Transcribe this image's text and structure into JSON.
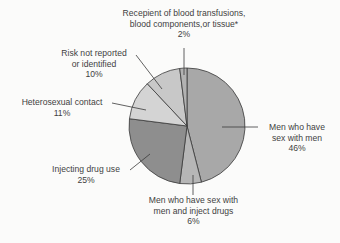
{
  "chart_data": {
    "type": "pie",
    "title": "",
    "start_angle_deg": 0,
    "direction": "clockwise",
    "slices": [
      {
        "label": "Men who have sex with men",
        "value": 46,
        "display": "46%",
        "color": "#a8a8a8"
      },
      {
        "label": "Men who have sex with men and inject drugs",
        "value": 6,
        "display": "6%",
        "color": "#b6b6b6"
      },
      {
        "label": "Injecting drug use",
        "value": 25,
        "display": "25%",
        "color": "#8e8e8e"
      },
      {
        "label": "Heterosexual contact",
        "value": 11,
        "display": "11%",
        "color": "#d4d4d4"
      },
      {
        "label": "Risk not reported or identified",
        "value": 10,
        "display": "10%",
        "color": "#c8c8c8"
      },
      {
        "label": "Recepient of blood transfusions, blood components,or tissue*",
        "value": 2,
        "display": "2%",
        "color": "#b2b2b2"
      }
    ],
    "legend": "none (callout labels)"
  },
  "labels": {
    "msm": {
      "line1": "Men who have",
      "line2": "sex with men",
      "pct": "46%"
    },
    "msm_idu": {
      "line1": "Men who have sex with",
      "line2": "men and inject drugs",
      "pct": "6%"
    },
    "idu": {
      "line1": "Injecting drug use",
      "pct": "25%"
    },
    "hetero": {
      "line1": "Heterosexual contact",
      "pct": "11%"
    },
    "risk": {
      "line1": "Risk not reported",
      "line2": "or identified",
      "pct": "10%"
    },
    "blood": {
      "line1": "Recepient of blood transfusions,",
      "line2": "blood components,or tissue*",
      "pct": "2%"
    }
  }
}
